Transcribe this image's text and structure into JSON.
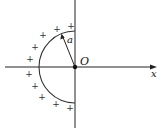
{
  "figure": {
    "type": "semicircle charge distribution diagram",
    "labels": {
      "origin": "O",
      "x_axis": "x",
      "radius": "a"
    },
    "charge_symbol": "+",
    "geometry": {
      "origin": [
        75,
        67
      ],
      "radius_px": 36,
      "x_axis": {
        "x1": 5,
        "x2": 156,
        "y": 67
      },
      "y_axis": {
        "x": 75,
        "y1": 0,
        "y2": 128
      },
      "radius_line_end": [
        62,
        35
      ]
    },
    "charges": [
      [
        71,
        26
      ],
      [
        57,
        29
      ],
      [
        43,
        35
      ],
      [
        35,
        47
      ],
      [
        30,
        59
      ],
      [
        29,
        74
      ],
      [
        35,
        86
      ],
      [
        42,
        97
      ],
      [
        56,
        104
      ],
      [
        70,
        108
      ]
    ]
  }
}
